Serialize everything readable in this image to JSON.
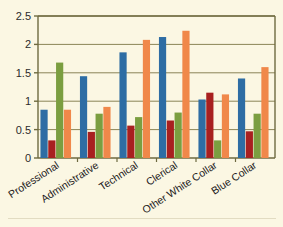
{
  "chart_data": {
    "type": "bar",
    "title": "",
    "subtitle": "",
    "xlabel": "",
    "ylabel": "",
    "ylim": [
      0,
      2.5
    ],
    "yticks": [
      "0",
      "0.5",
      "1",
      "1.5",
      "2",
      "2.5"
    ],
    "ytick_values": [
      0,
      0.5,
      1,
      1.5,
      2,
      2.5
    ],
    "grid": true,
    "grid_axis": "y",
    "legend": false,
    "legend_position": "none",
    "categories": [
      "Professional",
      "Administrative",
      "Technical",
      "Clerical",
      "Other White Collar",
      "Blue Collar"
    ],
    "series": [
      {
        "name": "Series 1",
        "color": "#2e6da4",
        "values": [
          0.85,
          1.44,
          1.86,
          2.13,
          1.03,
          1.4
        ]
      },
      {
        "name": "Series 2",
        "color": "#a82020",
        "values": [
          0.31,
          0.46,
          0.57,
          0.66,
          1.15,
          0.47
        ]
      },
      {
        "name": "Series 3",
        "color": "#7b9e40",
        "values": [
          1.68,
          0.78,
          0.72,
          0.8,
          0.31,
          0.78
        ]
      },
      {
        "name": "Series 4",
        "color": "#f0884a",
        "values": [
          0.85,
          0.9,
          2.08,
          2.24,
          1.12,
          1.6
        ]
      }
    ]
  },
  "style": {
    "background": "#fbf7e3",
    "axis_color": "#6e6a40",
    "grid_color": "#8a8457",
    "plot_background": "#fbf7e3",
    "tick_text_color": "#2b2b2b",
    "category_text_color": "#23211c"
  },
  "axis": {
    "y_tick_0": "0",
    "y_tick_1": "0.5",
    "y_tick_2": "1",
    "y_tick_3": "1.5",
    "y_tick_4": "2",
    "y_tick_5": "2.5"
  },
  "categories_text": {
    "c0": "Professional",
    "c1": "Administrative",
    "c2": "Technical",
    "c3": "Clerical",
    "c4": "Other White Collar",
    "c5": "Blue Collar"
  }
}
